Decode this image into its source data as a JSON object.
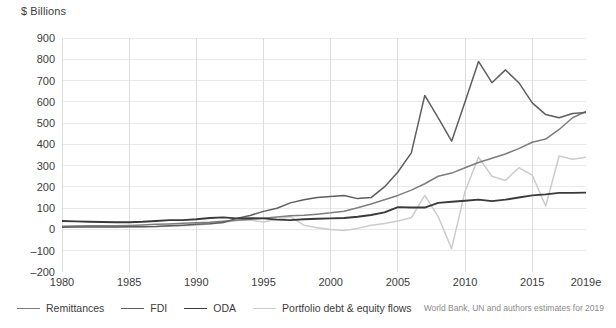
{
  "axis_title": "$ Billions",
  "source_note": "World Bank, UN and authors estimates for 2019",
  "legend": {
    "items": [
      {
        "label": "Remittances",
        "color": "#7d7d7d",
        "width": 1.6
      },
      {
        "label": "FDI",
        "color": "#5e5e5e",
        "width": 1.6
      },
      {
        "label": "ODA",
        "color": "#3a3a3a",
        "width": 1.8
      },
      {
        "label": "Portfolio debt & equity flows",
        "color": "#cccccc",
        "width": 1.6
      }
    ]
  },
  "chart_data": {
    "type": "line",
    "title": "",
    "xlabel": "",
    "ylabel": "$ Billions",
    "ylim": [
      -200,
      900
    ],
    "ytick_step": 100,
    "yticks": [
      900,
      800,
      700,
      600,
      500,
      400,
      300,
      200,
      100,
      0,
      -100,
      -200
    ],
    "xlim": [
      1980,
      2019
    ],
    "xticks": [
      1980,
      1985,
      1990,
      1995,
      2000,
      2005,
      2010,
      2015,
      2019
    ],
    "xtick_labels": [
      "1980",
      "1985",
      "1990",
      "1995",
      "2000",
      "2005",
      "2010",
      "2015",
      "2019e"
    ],
    "grid": true,
    "legend_position": "bottom-left",
    "x": [
      1980,
      1981,
      1982,
      1983,
      1984,
      1985,
      1986,
      1987,
      1988,
      1989,
      1990,
      1991,
      1992,
      1993,
      1994,
      1995,
      1996,
      1997,
      1998,
      1999,
      2000,
      2001,
      2002,
      2003,
      2004,
      2005,
      2006,
      2007,
      2008,
      2009,
      2010,
      2011,
      2012,
      2013,
      2014,
      2015,
      2016,
      2017,
      2018,
      2019
    ],
    "series": [
      {
        "name": "Remittances",
        "color": "#7d7d7d",
        "values": [
          15,
          16,
          17,
          17,
          18,
          19,
          21,
          24,
          26,
          29,
          32,
          34,
          38,
          43,
          48,
          53,
          58,
          64,
          67,
          72,
          78,
          86,
          102,
          120,
          140,
          160,
          185,
          215,
          250,
          265,
          290,
          315,
          335,
          355,
          380,
          410,
          425,
          470,
          525,
          555
        ]
      },
      {
        "name": "FDI",
        "color": "#5e5e5e",
        "values": [
          10,
          11,
          11,
          12,
          12,
          13,
          13,
          14,
          17,
          20,
          24,
          27,
          33,
          52,
          66,
          85,
          100,
          125,
          140,
          150,
          155,
          160,
          145,
          150,
          200,
          270,
          360,
          630,
          525,
          415,
          600,
          790,
          690,
          750,
          690,
          595,
          540,
          525,
          545,
          550
        ]
      },
      {
        "name": "ODA",
        "color": "#3a3a3a",
        "values": [
          40,
          38,
          36,
          35,
          34,
          34,
          36,
          40,
          44,
          44,
          48,
          54,
          57,
          52,
          53,
          52,
          46,
          44,
          48,
          50,
          52,
          54,
          60,
          68,
          80,
          105,
          103,
          103,
          125,
          130,
          135,
          140,
          133,
          140,
          150,
          160,
          165,
          172,
          172,
          173
        ]
      },
      {
        "name": "Portfolio debt & equity flows",
        "color": "#cccccc",
        "values": [
          13,
          14,
          14,
          13,
          12,
          12,
          13,
          14,
          15,
          17,
          20,
          27,
          33,
          42,
          44,
          35,
          48,
          60,
          20,
          8,
          0,
          -5,
          5,
          20,
          28,
          40,
          55,
          160,
          60,
          -90,
          180,
          340,
          250,
          230,
          290,
          255,
          110,
          345,
          330,
          340
        ]
      }
    ]
  }
}
